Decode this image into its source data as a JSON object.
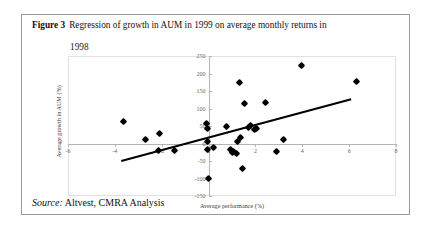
{
  "figure": {
    "number_label": "Figure 3",
    "caption_line1": "Regression of growth in AUM in 1999 on average monthly returns in",
    "caption_line2": "1998",
    "source_label": "Source:",
    "source_text": "Altvest, CMRA Analysis"
  },
  "chart_data": {
    "type": "scatter",
    "title": "",
    "xlabel": "Average performance (%)",
    "ylabel": "Average growth in AUM (%)",
    "xlim": [
      -6,
      8
    ],
    "ylim": [
      -150,
      250
    ],
    "xticks": [
      -6,
      -4,
      -2,
      0,
      2,
      4,
      6,
      8
    ],
    "yticks": [
      -150,
      -100,
      -50,
      0,
      50,
      100,
      150,
      200,
      250
    ],
    "xtick_labels": [
      "-6",
      "-4",
      "-2",
      "0",
      "2",
      "4",
      "6",
      "8"
    ],
    "ytick_labels": [
      "-150",
      "-100",
      "-50",
      "0",
      "50",
      "100",
      "150",
      "200",
      "250"
    ],
    "grid": false,
    "legend": false,
    "marker": "diamond",
    "marker_color": "#000000",
    "points": [
      {
        "x": -3.65,
        "y": 62
      },
      {
        "x": -2.7,
        "y": 12
      },
      {
        "x": -2.1,
        "y": 28
      },
      {
        "x": -2.15,
        "y": -20
      },
      {
        "x": -1.45,
        "y": -20
      },
      {
        "x": -0.08,
        "y": 56
      },
      {
        "x": -0.05,
        "y": 44
      },
      {
        "x": -0.05,
        "y": 5
      },
      {
        "x": -0.05,
        "y": -18
      },
      {
        "x": -0.02,
        "y": -100
      },
      {
        "x": 0.22,
        "y": -12
      },
      {
        "x": 0.78,
        "y": 50
      },
      {
        "x": 0.92,
        "y": -16
      },
      {
        "x": 1.0,
        "y": -25
      },
      {
        "x": 1.08,
        "y": -24
      },
      {
        "x": 1.18,
        "y": -28
      },
      {
        "x": 1.22,
        "y": 5
      },
      {
        "x": 1.3,
        "y": 175
      },
      {
        "x": 1.38,
        "y": 16
      },
      {
        "x": 1.45,
        "y": -70
      },
      {
        "x": 1.55,
        "y": 113
      },
      {
        "x": 1.7,
        "y": 46
      },
      {
        "x": 1.8,
        "y": 52
      },
      {
        "x": 1.95,
        "y": 40
      },
      {
        "x": 2.05,
        "y": 42
      },
      {
        "x": 2.45,
        "y": 116
      },
      {
        "x": 2.9,
        "y": -22
      },
      {
        "x": 3.2,
        "y": 12
      },
      {
        "x": 3.95,
        "y": 222
      },
      {
        "x": 6.3,
        "y": 178
      }
    ],
    "trendline": {
      "x_start": -3.75,
      "y_start": -48,
      "x_end": 6.05,
      "y_end": 128
    }
  }
}
